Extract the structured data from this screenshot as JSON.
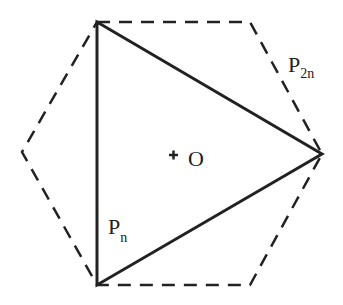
{
  "diagram": {
    "labels": {
      "hexagon": {
        "main": "P",
        "sub": "2n"
      },
      "triangle": {
        "main": "P",
        "sub": "n"
      },
      "center": "O",
      "center_marker": "+"
    },
    "colors": {
      "stroke": "#222222",
      "background": "#ffffff"
    }
  }
}
